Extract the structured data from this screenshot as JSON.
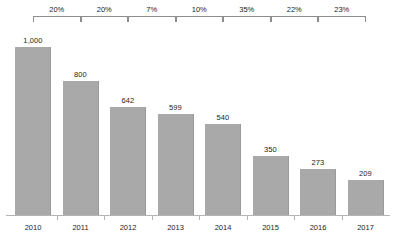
{
  "chart_data": {
    "type": "bar",
    "title": "",
    "subtitle": "",
    "xlabel": "",
    "ylabel": "",
    "grid": false,
    "legend": null,
    "ylim": [
      0,
      1000
    ],
    "categories": [
      "2010",
      "2011",
      "2012",
      "2013",
      "2014",
      "2015",
      "2016",
      "2017"
    ],
    "values": [
      1000,
      800,
      642,
      599,
      540,
      350,
      273,
      209
    ],
    "value_labels": [
      "1,000",
      "800",
      "642",
      "599",
      "540",
      "350",
      "273",
      "209"
    ],
    "annotations": {
      "type": "period-over-period-decline-brackets",
      "labels": [
        "20%",
        "20%",
        "7%",
        "10%",
        "35%",
        "22%",
        "23%"
      ],
      "spans": [
        [
          "2010",
          "2011"
        ],
        [
          "2011",
          "2012"
        ],
        [
          "2012",
          "2013"
        ],
        [
          "2013",
          "2014"
        ],
        [
          "2014",
          "2015"
        ],
        [
          "2015",
          "2016"
        ],
        [
          "2016",
          "2017"
        ]
      ]
    },
    "colors": {
      "bar_fill": "#a9a9a9",
      "bar_edge": "#9a9a9a",
      "axis_line": "#b4b4b4",
      "bracket_line": "#8d8d8d",
      "text": "#1d1d1d",
      "background": "#ffffff"
    }
  },
  "layout": {
    "baseline_y": 215,
    "bar_width": 36,
    "bar_slot_width": 47.5,
    "first_bar_left": 15,
    "value_max_pixel_height": 168
  }
}
